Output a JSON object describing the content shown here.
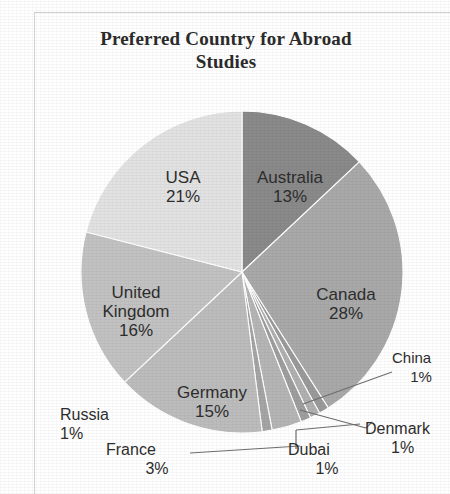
{
  "chart_data": {
    "type": "pie",
    "title_line1": "Preferred Country for Abroad",
    "title_line2": "Studies",
    "xlabel": "",
    "ylabel": "",
    "legend": "none",
    "grid": false,
    "label_format": "name + percent",
    "start_angle_deg": 0,
    "direction": "clockwise",
    "categories": [
      "Australia",
      "Canada",
      "China",
      "Denmark",
      "Dubai",
      "France",
      "Russia",
      "Germany",
      "United Kingdom",
      "USA"
    ],
    "values": [
      13,
      28,
      1,
      1,
      1,
      3,
      1,
      15,
      16,
      21
    ],
    "unit": "%",
    "total": 100,
    "slices": [
      {
        "name": "Australia",
        "value": 13,
        "percent_label": "13%",
        "color": "#8a8a8a",
        "label_placement": "inside"
      },
      {
        "name": "Canada",
        "value": 28,
        "percent_label": "28%",
        "color": "#a9a9a9",
        "label_placement": "inside"
      },
      {
        "name": "China",
        "value": 1,
        "percent_label": "1%",
        "color": "#9a9a9a",
        "label_placement": "outside-leader"
      },
      {
        "name": "Denmark",
        "value": 1,
        "percent_label": "1%",
        "color": "#b0b0b0",
        "label_placement": "outside-leader"
      },
      {
        "name": "Dubai",
        "value": 1,
        "percent_label": "1%",
        "color": "#9e9e9e",
        "label_placement": "outside-leader"
      },
      {
        "name": "France",
        "value": 3,
        "percent_label": "3%",
        "color": "#b5b5b5",
        "label_placement": "outside-leader"
      },
      {
        "name": "Russia",
        "value": 1,
        "percent_label": "1%",
        "color": "#a5a5a5",
        "label_placement": "outside"
      },
      {
        "name": "Germany",
        "value": 15,
        "percent_label": "15%",
        "color": "#bcbcbc",
        "label_placement": "inside"
      },
      {
        "name": "United Kingdom",
        "value": 16,
        "percent_label": "16%",
        "color": "#c2c2c2",
        "label_placement": "inside"
      },
      {
        "name": "USA",
        "value": 21,
        "percent_label": "21%",
        "color": "#e2e2e2",
        "label_placement": "inside"
      }
    ]
  },
  "labels": {
    "usa": {
      "name": "USA",
      "pct": "21%"
    },
    "australia": {
      "name": "Australia",
      "pct": "13%"
    },
    "canada": {
      "name": "Canada",
      "pct": "28%"
    },
    "uk": {
      "name_line1": "United",
      "name_line2": "Kingdom",
      "pct": "16%"
    },
    "germany": {
      "name": "Germany",
      "pct": "15%"
    },
    "russia": {
      "name": "Russia",
      "pct": "1%"
    },
    "france": {
      "name": "France",
      "pct": "3%"
    },
    "dubai": {
      "name": "Dubai",
      "pct": "1%"
    },
    "denmark": {
      "name": "Denmark",
      "pct": "1%"
    },
    "china": {
      "name": "China",
      "pct": "1%"
    }
  }
}
